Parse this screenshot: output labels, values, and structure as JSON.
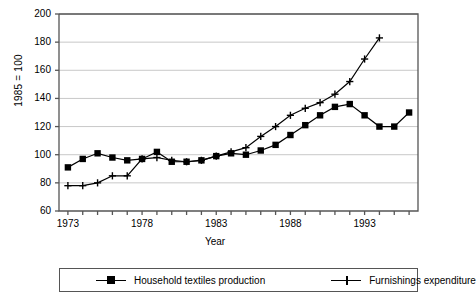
{
  "chart_data": {
    "type": "line",
    "title": "",
    "xlabel": "Year",
    "ylabel": "1985 = 100",
    "xlim": [
      1972.4,
      1996.6
    ],
    "ylim": [
      60,
      200
    ],
    "grid": true,
    "legend_position": "bottom",
    "x": [
      1973,
      1974,
      1975,
      1976,
      1977,
      1978,
      1979,
      1980,
      1981,
      1982,
      1983,
      1984,
      1985,
      1986,
      1987,
      1988,
      1989,
      1990,
      1991,
      1992,
      1993,
      1994,
      1995,
      1996
    ],
    "y_ticks": [
      60,
      80,
      100,
      120,
      140,
      160,
      180,
      200
    ],
    "x_ticks": [
      1973,
      1974,
      1975,
      1976,
      1977,
      1978,
      1979,
      1980,
      1981,
      1982,
      1983,
      1984,
      1985,
      1986,
      1987,
      1988,
      1989,
      1990,
      1991,
      1992,
      1993,
      1994,
      1995,
      1996
    ],
    "x_tick_labels": [
      {
        "value": 1973,
        "label": "1973"
      },
      {
        "value": 1978,
        "label": "1978"
      },
      {
        "value": 1983,
        "label": "1983"
      },
      {
        "value": 1988,
        "label": "1988"
      },
      {
        "value": 1993,
        "label": "1993"
      }
    ],
    "series": [
      {
        "name": "Household textiles production",
        "marker": "square",
        "x": [
          1973,
          1974,
          1975,
          1976,
          1977,
          1978,
          1979,
          1980,
          1981,
          1982,
          1983,
          1984,
          1985,
          1986,
          1987,
          1988,
          1989,
          1990,
          1991,
          1992,
          1993,
          1994,
          1995,
          1996
        ],
        "values": [
          91,
          97,
          101,
          98,
          96,
          97,
          102,
          95,
          95,
          96,
          99,
          101,
          100,
          103,
          107,
          114,
          121,
          128,
          134,
          136,
          128,
          120,
          120,
          130
        ]
      },
      {
        "name": "Furnishings expenditure",
        "marker": "plus",
        "x": [
          1973,
          1974,
          1975,
          1976,
          1977,
          1978,
          1979,
          1980,
          1981,
          1982,
          1983,
          1984,
          1985,
          1986,
          1987,
          1988,
          1989,
          1990,
          1991,
          1992,
          1993,
          1994
        ],
        "values": [
          78,
          78,
          80,
          85,
          85,
          97,
          98,
          96,
          95,
          96,
          99,
          102,
          105,
          113,
          120,
          128,
          133,
          137,
          143,
          152,
          168,
          183
        ]
      }
    ]
  },
  "legend": {
    "items": [
      {
        "label": "Household textiles production"
      },
      {
        "label": "Furnishings expenditure"
      }
    ]
  },
  "axis": {
    "y_title": "1985 = 100",
    "x_title": "Year"
  },
  "colors": {
    "series_1": "#000000",
    "series_2": "#000000",
    "grid": "#c8c8c8",
    "axis": "#555555"
  }
}
